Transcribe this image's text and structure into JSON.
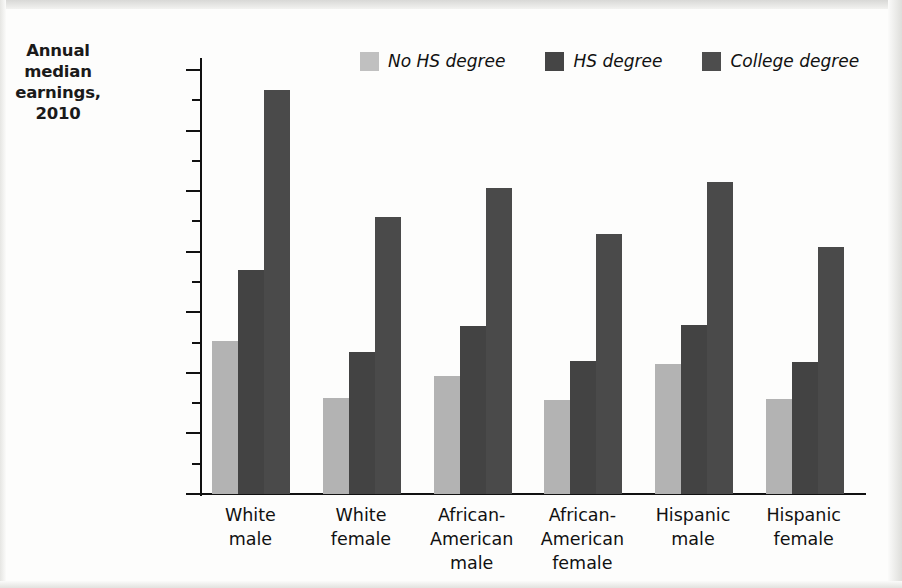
{
  "axis_title": "Annual\nmedian\nearnings,\n2010",
  "axis_title_lines": [
    "Annual",
    "median",
    "earnings,",
    "2010"
  ],
  "legend": {
    "items": [
      {
        "label": "No HS degree",
        "color": "#c0c0c0"
      },
      {
        "label": "HS degree",
        "color": "#454545"
      },
      {
        "label": "College degree",
        "color": "#4d4d4d"
      }
    ]
  },
  "y_ticks": [
    "$70,000",
    "60,000",
    "50,000",
    "40,000",
    "30,000",
    "20,000",
    "10,000",
    "0"
  ],
  "chart_data": {
    "type": "bar",
    "title": "",
    "xlabel": "",
    "ylabel": "Annual median earnings, 2010",
    "ylim": [
      0,
      70000
    ],
    "ytick_values": [
      70000,
      60000,
      50000,
      40000,
      30000,
      20000,
      10000,
      0
    ],
    "ytick_labels": [
      "$70,000",
      "60,000",
      "50,000",
      "40,000",
      "30,000",
      "20,000",
      "10,000",
      "0"
    ],
    "minor_tick_interval": 5000,
    "grid": false,
    "legend_position": "top-center",
    "categories": [
      "White male",
      "White female",
      "African-American male",
      "African-American female",
      "Hispanic male",
      "Hispanic female"
    ],
    "category_lines": [
      [
        "White",
        "male"
      ],
      [
        "White",
        "female"
      ],
      [
        "African-",
        "American",
        "male"
      ],
      [
        "African-",
        "American",
        "female"
      ],
      [
        "Hispanic",
        "male"
      ],
      [
        "Hispanic",
        "female"
      ]
    ],
    "series": [
      {
        "name": "No HS degree",
        "color": "#b3b3b3",
        "values": [
          25300,
          15900,
          19500,
          15600,
          21500,
          15700
        ]
      },
      {
        "name": "HS degree",
        "color": "#434343",
        "values": [
          36900,
          23400,
          27700,
          22000,
          27900,
          21800
        ]
      },
      {
        "name": "College degree",
        "color": "#4a4a4a",
        "values": [
          66700,
          45800,
          50600,
          43000,
          51500,
          40800
        ]
      }
    ]
  }
}
